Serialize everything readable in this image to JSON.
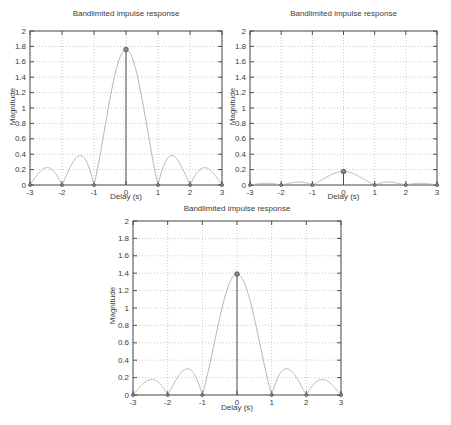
{
  "page": {
    "background": "#ffffff"
  },
  "colors": {
    "curve": "#b2b2b2",
    "stem": "#4d4d4d",
    "marker_fill": "#8a8a8a",
    "marker_edge": "#4d4d4d",
    "grid": "#c9c9c9",
    "axis_box": "#4d4d4d",
    "text": "#3c3c3c"
  },
  "chart_data": [
    {
      "type": "line",
      "title": "Bandlimited impulse response",
      "xlabel": "Delay (s)",
      "ylabel": "Magnitude",
      "xlim": [
        -3,
        3
      ],
      "ylim": [
        0,
        2
      ],
      "grid": true,
      "xticks": [
        -3,
        -2,
        -1,
        0,
        1,
        2,
        3
      ],
      "yticks": [
        0,
        0.2,
        0.4,
        0.6,
        0.8,
        1,
        1.2,
        1.4,
        1.6,
        1.8,
        2
      ],
      "xtick_labels": [
        "-3",
        "-2",
        "-1",
        "0",
        "1",
        "2",
        "3"
      ],
      "ytick_labels": [
        "0",
        "0.2",
        "0.4",
        "0.6",
        "0.8",
        "1",
        "1.2",
        "1.4",
        "1.6",
        "1.8",
        "2"
      ],
      "curve": {
        "function": "amplitude*abs(sinc(x))",
        "amplitude": 1.76,
        "zeros": [
          -3,
          -2,
          -1,
          1,
          2,
          3
        ]
      },
      "stems": {
        "x": [
          -3,
          -2,
          -1,
          0,
          1,
          2,
          3
        ],
        "y": [
          0,
          0,
          0,
          1.76,
          0,
          0,
          0
        ]
      },
      "peak": {
        "x": 0,
        "y": 1.76
      },
      "layout": {
        "left": 30,
        "top": 31,
        "right": 222,
        "bottom": 185
      }
    },
    {
      "type": "line",
      "title": "Bandlimited impulse response",
      "xlabel": "Delay (s)",
      "ylabel": "Magnitude",
      "xlim": [
        -3,
        3
      ],
      "ylim": [
        0,
        2
      ],
      "grid": true,
      "xticks": [
        -3,
        -2,
        -1,
        0,
        1,
        2,
        3
      ],
      "yticks": [
        0,
        0.2,
        0.4,
        0.6,
        0.8,
        1,
        1.2,
        1.4,
        1.6,
        1.8,
        2
      ],
      "xtick_labels": [
        "-3",
        "-2",
        "-1",
        "0",
        "1",
        "2",
        "3"
      ],
      "ytick_labels": [
        "0",
        "0.2",
        "0.4",
        "0.6",
        "0.8",
        "1",
        "1.2",
        "1.4",
        "1.6",
        "1.8",
        "2"
      ],
      "curve": {
        "function": "amplitude*abs(sinc(x))",
        "amplitude": 0.175,
        "zeros": [
          -3,
          -2,
          -1,
          1,
          2,
          3
        ]
      },
      "stems": {
        "x": [
          -3,
          -2,
          -1,
          0,
          1,
          2,
          3
        ],
        "y": [
          0,
          0,
          0,
          0.175,
          0,
          0,
          0
        ]
      },
      "peak": {
        "x": 0,
        "y": 0.175
      },
      "layout": {
        "left": 250,
        "top": 31,
        "right": 437,
        "bottom": 185
      }
    },
    {
      "type": "line",
      "title": "Bandlimited impulse response",
      "xlabel": "Delay (s)",
      "ylabel": "Magnitude",
      "xlim": [
        -3,
        3
      ],
      "ylim": [
        0,
        2
      ],
      "grid": true,
      "xticks": [
        -3,
        -2,
        -1,
        0,
        1,
        2,
        3
      ],
      "yticks": [
        0,
        0.2,
        0.4,
        0.6,
        0.8,
        1,
        1.2,
        1.4,
        1.6,
        1.8,
        2
      ],
      "xtick_labels": [
        "-3",
        "-2",
        "-1",
        "0",
        "1",
        "2",
        "3"
      ],
      "ytick_labels": [
        "0",
        "0.2",
        "0.4",
        "0.6",
        "0.8",
        "1",
        "1.2",
        "1.4",
        "1.6",
        "1.8",
        "2"
      ],
      "curve": {
        "function": "amplitude*abs(sinc(x))",
        "amplitude": 1.39,
        "zeros": [
          -3,
          -2,
          -1,
          1,
          2,
          3
        ]
      },
      "stems": {
        "x": [
          -3,
          -2,
          -1,
          0,
          1,
          2,
          3
        ],
        "y": [
          0,
          0,
          0,
          1.39,
          0,
          0,
          0
        ]
      },
      "peak": {
        "x": 0,
        "y": 1.39
      },
      "layout": {
        "left": 133,
        "top": 221,
        "right": 341,
        "bottom": 395
      }
    }
  ]
}
